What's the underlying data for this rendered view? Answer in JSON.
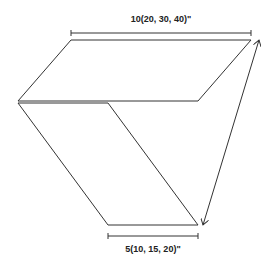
{
  "diagram": {
    "top_dimension": {
      "label": "10(20, 30, 40)\"",
      "x1": 71,
      "x2": 251,
      "y": 33
    },
    "bottom_dimension": {
      "label": "5(10, 15, 20)\"",
      "x1": 108,
      "x2": 198,
      "y": 236
    },
    "top_panel": {
      "points": [
        [
          71,
          40
        ],
        [
          251,
          40
        ],
        [
          198,
          101
        ],
        [
          18,
          101
        ]
      ]
    },
    "lower_panel": {
      "points": [
        [
          18,
          103
        ],
        [
          108,
          103
        ],
        [
          198,
          225
        ],
        [
          108,
          225
        ]
      ]
    },
    "diagonal_arrow": {
      "from": [
        259,
        40
      ],
      "to": [
        203,
        225
      ],
      "style": "double-headed"
    },
    "colors": {
      "stroke": "#333333",
      "text": "#222222",
      "background": "#ffffff"
    }
  }
}
